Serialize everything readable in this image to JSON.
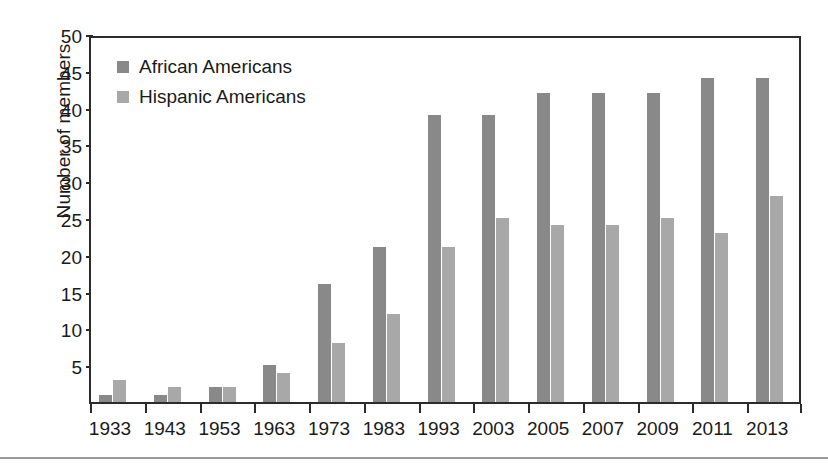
{
  "chart_data": {
    "type": "bar",
    "title": "",
    "xlabel": "",
    "ylabel": "Number of members",
    "ylim": [
      0,
      50
    ],
    "yticks": [
      5,
      10,
      15,
      20,
      25,
      30,
      35,
      40,
      45,
      50
    ],
    "grid": false,
    "legend_position": "top-left",
    "categories": [
      "1933",
      "1943",
      "1953",
      "1963",
      "1973",
      "1983",
      "1993",
      "2003",
      "2005",
      "2007",
      "2009",
      "2011",
      "2013"
    ],
    "series": [
      {
        "name": "African Americans",
        "color": "#898989",
        "values": [
          1,
          1,
          2,
          5,
          16,
          21,
          39,
          39,
          42,
          42,
          42,
          44,
          44
        ]
      },
      {
        "name": "Hispanic Americans",
        "color": "#a8a8a8",
        "values": [
          3,
          2,
          2,
          4,
          8,
          12,
          21,
          25,
          24,
          24,
          25,
          23,
          28
        ]
      }
    ]
  },
  "legend": {
    "items": [
      {
        "label": "African Americans"
      },
      {
        "label": "Hispanic Americans"
      }
    ]
  },
  "colors": {
    "series_african_americans": "#898989",
    "series_hispanic_americans": "#a8a8a8",
    "axis": "#2b2b2b",
    "text": "#1a1a1a",
    "background": "#ffffff",
    "bottom_rule": "#9a9a9a"
  }
}
